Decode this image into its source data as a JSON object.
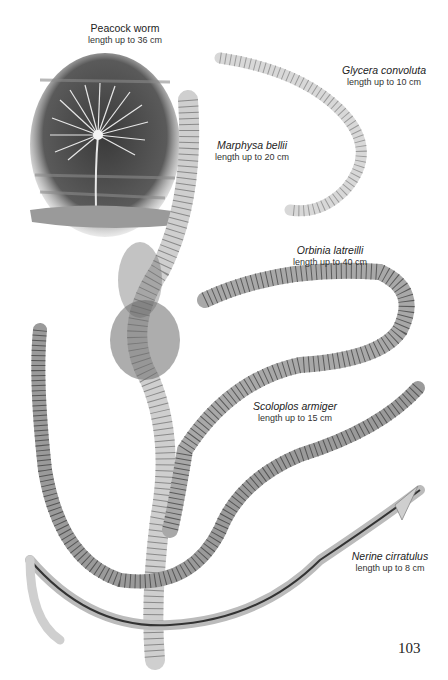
{
  "page": {
    "number": "103",
    "species": [
      {
        "name": "Peacock worm",
        "italic": false,
        "length": "length up to 36 cm"
      },
      {
        "name": "Glycera convoluta",
        "italic": true,
        "length": "length up to 10 cm"
      },
      {
        "name": "Marphysa bellii",
        "italic": true,
        "length": "length up to 20 cm"
      },
      {
        "name": "Orbinia latreilli",
        "italic": true,
        "length": "length up to 40 cm"
      },
      {
        "name": "Scoloplos armiger",
        "italic": true,
        "length": "length up to 15 cm"
      },
      {
        "name": "Nerine cirratulus",
        "italic": true,
        "length": "length up to 8 cm"
      }
    ]
  },
  "colors": {
    "background": "#ffffff",
    "peacock_bg": "#4a4a4a",
    "worm_light": "#d8d8d8",
    "worm_mid": "#a8a8a8",
    "worm_dark": "#6a6a6a"
  }
}
